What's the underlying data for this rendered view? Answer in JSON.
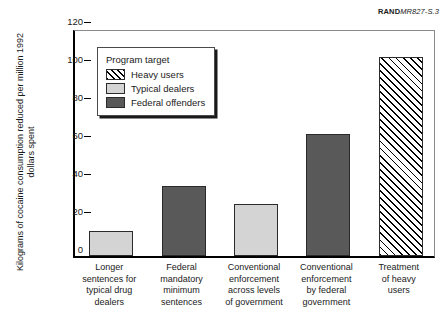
{
  "source_tag": {
    "brand": "RAND",
    "document_id": "MR827-S.3"
  },
  "legend": {
    "title": "Program target",
    "items": [
      {
        "label": "Heavy users",
        "style": "hatch"
      },
      {
        "label": "Typical dealers",
        "style": "light"
      },
      {
        "label": "Federal offenders",
        "style": "dark"
      }
    ]
  },
  "colors": {
    "light_gray": "#d4d4d4",
    "dark_gray": "#595959",
    "hatch_line": "#000000",
    "axis": "#000000"
  },
  "chart_data": {
    "type": "bar",
    "title": "",
    "xlabel": "",
    "ylabel": "Kilograms of cocaine consumption reduced per million 1992 dollars spent",
    "ylim": [
      0,
      120
    ],
    "yticks": [
      0,
      20,
      40,
      60,
      80,
      100,
      120
    ],
    "grid": false,
    "legend_position": "upper-left-inside",
    "categories": [
      "Longer\nsentences for\ntypical drug\ndealers",
      "Federal\nmandatory\nminimum\nsentences",
      "Conventional\nenforcement\nacross levels\nof government",
      "Conventional\nenforcement\nby federal\ngovernment",
      "Treatment\nof heavy\nusers"
    ],
    "values": [
      13,
      37,
      27.5,
      64,
      104.5
    ],
    "bar_styles": [
      "light",
      "dark",
      "light",
      "dark",
      "hatch"
    ],
    "series": [
      {
        "name": "Kilograms of cocaine consumption reduced per million 1992 dollars spent",
        "values": [
          13,
          37,
          27.5,
          64,
          104.5
        ]
      }
    ]
  }
}
